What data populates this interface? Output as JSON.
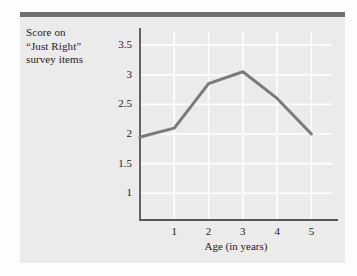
{
  "figure": {
    "background_color": "#ebebeb",
    "top_bar_color": "#6f6f6f",
    "page_background": "#fdfdfd"
  },
  "y_axis_caption": {
    "line1": "Score on",
    "line2": "“Just Right”",
    "line3": "survey items"
  },
  "chart_data": {
    "type": "line",
    "title": "",
    "xlabel": "Age (in years)",
    "ylabel": "Score on “Just Right” survey items",
    "x": [
      0,
      1,
      2,
      3,
      4,
      5
    ],
    "values": [
      1.95,
      2.1,
      2.85,
      3.05,
      2.6,
      2.0
    ],
    "series": [
      {
        "name": "Score on “Just Right” survey items",
        "values": [
          1.95,
          2.1,
          2.85,
          3.05,
          2.6,
          2.0
        ],
        "color": "#7a7a7a"
      }
    ],
    "xlim": [
      0,
      5.6
    ],
    "ylim": [
      0.55,
      3.72
    ],
    "xticks": [
      1,
      2,
      3,
      4,
      5
    ],
    "xtick_labels": [
      "1",
      "2",
      "3",
      "4",
      "5"
    ],
    "yticks": [
      1,
      1.5,
      2,
      2.5,
      3,
      3.5
    ],
    "ytick_labels": [
      "1",
      "1.5",
      "2",
      "2.5",
      "3",
      "3.5"
    ],
    "grid": true,
    "grid_color": "#ffffff",
    "legend": "none",
    "axis_color": "#555555",
    "line_color": "#7a7a7a",
    "line_width": 3,
    "markers": "none"
  }
}
